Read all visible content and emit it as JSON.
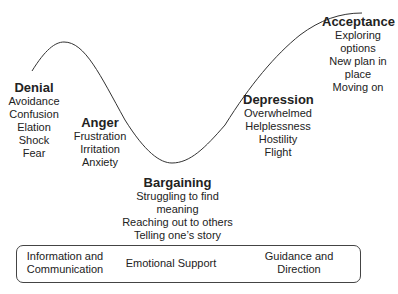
{
  "stages": [
    {
      "title": "Denial",
      "items": [
        "Avoidance",
        "Confusion",
        "Elation",
        "Shock",
        "Fear"
      ]
    },
    {
      "title": "Anger",
      "items": [
        "Frustration",
        "Irritation",
        "Anxiety"
      ]
    },
    {
      "title": "Bargaining",
      "items": [
        "Struggling to find",
        "meaning",
        "Reaching out to others",
        "Telling one’s story"
      ]
    },
    {
      "title": "Depression",
      "items": [
        "Overwhelmed",
        "Helplessness",
        "Hostility",
        "Flight"
      ]
    },
    {
      "title": "Acceptance",
      "items": [
        "Exploring",
        "options",
        "New plan in",
        "place",
        "Moving on"
      ]
    }
  ],
  "support": [
    {
      "line1": "Information and",
      "line2": "Communication"
    },
    {
      "line1": "Emotional Support",
      "line2": ""
    },
    {
      "line1": "Guidance and",
      "line2": "Direction"
    }
  ]
}
